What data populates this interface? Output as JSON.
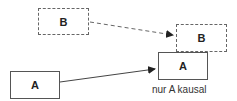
{
  "diagram": {
    "nodes": [
      {
        "id": "b_past",
        "label": "B",
        "style": "dashed"
      },
      {
        "id": "b_future",
        "label": "B",
        "style": "dashed"
      },
      {
        "id": "a_future",
        "label": "A",
        "style": "solid"
      },
      {
        "id": "a_past",
        "label": "A",
        "style": "solid"
      }
    ],
    "edges": [
      {
        "from": "b_past",
        "to": "b_future",
        "style": "dashed"
      },
      {
        "from": "a_past",
        "to": "a_future",
        "style": "solid"
      }
    ],
    "caption": "nur A kausal"
  },
  "colors": {
    "line": "#555555",
    "text": "#222222"
  }
}
